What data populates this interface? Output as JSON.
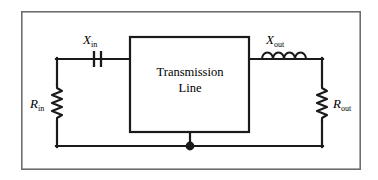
{
  "figure": {
    "kind": "circuit-schematic",
    "background_color": "#ffffff",
    "line_color": "#1a1a1a",
    "border": {
      "label": "figure-border",
      "x": 21,
      "y": 11,
      "width": 340,
      "height": 159,
      "stroke_width": 1.6
    }
  },
  "block": {
    "label_line1": "Transmission",
    "label_line2": "Line",
    "x": 130,
    "y": 37,
    "width": 119,
    "height": 95,
    "stroke_width": 2.2
  },
  "components": [
    {
      "id": "r-in",
      "type": "resistor",
      "orientation": "vertical",
      "symbol": "R",
      "subscript": "in",
      "label_x": 38,
      "label_y": 104,
      "x": 57,
      "y_top": 84,
      "y_bottom": 122
    },
    {
      "id": "x-in",
      "type": "capacitor",
      "orientation": "vertical-plates",
      "symbol": "X",
      "subscript": "in",
      "label_x": 88,
      "label_y": 44,
      "x": 97,
      "y": 59,
      "plate_gap": 7,
      "plate_height": 16
    },
    {
      "id": "x-out",
      "type": "inductor",
      "orientation": "horizontal",
      "coil_count": 4,
      "symbol": "X",
      "subscript": "out",
      "label_x": 272,
      "label_y": 44,
      "x_start": 262,
      "x_end": 306,
      "y": 59
    },
    {
      "id": "r-out",
      "type": "resistor",
      "orientation": "vertical",
      "symbol": "R",
      "subscript": "out",
      "label_x": 332,
      "label_y": 104,
      "x": 322,
      "y_top": 84,
      "y_bottom": 122
    }
  ],
  "wires": {
    "left_top_horizontal": {
      "x1": 57,
      "y1": 59,
      "x2": 130,
      "y2": 59
    },
    "left_vertical": {
      "x1": 57,
      "y1": 59,
      "x2": 57,
      "y2": 146
    },
    "right_top_horizontal": {
      "x1": 249,
      "y1": 59,
      "x2": 322,
      "y2": 59
    },
    "right_vertical": {
      "x1": 322,
      "y1": 59,
      "x2": 322,
      "y2": 146
    },
    "ground_rail": {
      "x1": 57,
      "y1": 146,
      "x2": 322,
      "y2": 146
    },
    "block_to_ground": {
      "x1": 190,
      "y1": 132,
      "x2": 190,
      "y2": 146
    },
    "stroke_width": 2.2
  },
  "junction": {
    "label": "ground-junction-dot",
    "cx": 190,
    "cy": 146,
    "r": 4.4,
    "filled": true
  }
}
